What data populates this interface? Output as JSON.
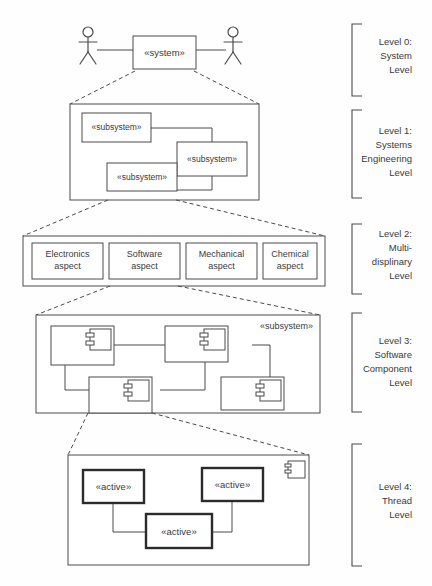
{
  "diagram": {
    "stereotypes": {
      "system": "«system»",
      "subsystem": "«subsystem»",
      "active": "«active»"
    },
    "colors": {
      "background": "#fefefe",
      "line": "#4a4a4a",
      "text": "#3a3a3a",
      "active_border": "#2b2b2b"
    }
  },
  "levels": [
    {
      "id": "level-0",
      "label_lines": [
        "Level 0:",
        "System",
        "Level"
      ],
      "elements": {
        "system_box": "«system»",
        "actor_left": "actor",
        "actor_right": "actor"
      }
    },
    {
      "id": "level-1",
      "label_lines": [
        "Level 1:",
        "Systems",
        "Engineering",
        "Level"
      ],
      "boxes": [
        {
          "name": "subsystem-1",
          "label": "«subsystem»"
        },
        {
          "name": "subsystem-2",
          "label": "«subsystem»"
        },
        {
          "name": "subsystem-3",
          "label": "«subsystem»"
        }
      ]
    },
    {
      "id": "level-2",
      "label_lines": [
        "Level 2:",
        "Multi-",
        "displinary",
        "Level"
      ],
      "boxes": [
        {
          "name": "electronics-aspect",
          "line1": "Electronics",
          "line2": "aspect"
        },
        {
          "name": "software-aspect",
          "line1": "Software",
          "line2": "aspect"
        },
        {
          "name": "mechanical-aspect",
          "line1": "Mechanical",
          "line2": "aspect"
        },
        {
          "name": "chemical-aspect",
          "line1": "Chemical",
          "line2": "aspect"
        }
      ]
    },
    {
      "id": "level-3",
      "label_lines": [
        "Level 3:",
        "Software",
        "Component",
        "Level"
      ],
      "container_label": "«subsystem»",
      "components": [
        {
          "name": "component-1"
        },
        {
          "name": "component-2"
        },
        {
          "name": "component-3"
        },
        {
          "name": "component-4"
        }
      ]
    },
    {
      "id": "level-4",
      "label_lines": [
        "Level 4:",
        "Thread",
        "Level"
      ],
      "boxes": [
        {
          "name": "active-1",
          "label": "«active»"
        },
        {
          "name": "active-2",
          "label": "«active»"
        },
        {
          "name": "active-3",
          "label": "«active»"
        }
      ],
      "component_icon": "component-icon"
    }
  ]
}
